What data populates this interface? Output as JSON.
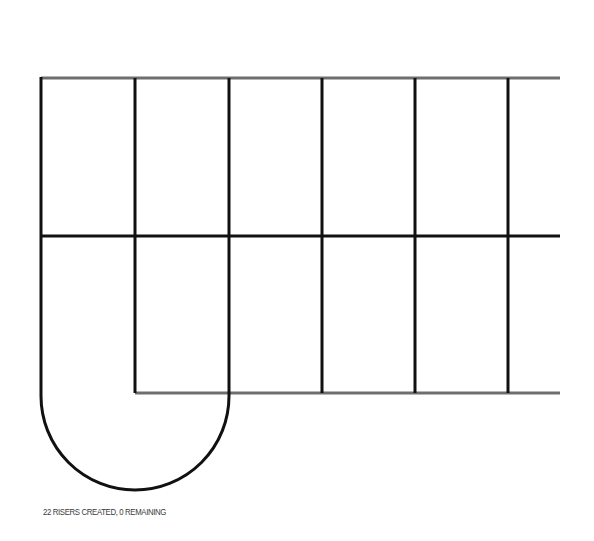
{
  "diagram": {
    "colors": {
      "background": "#ffffff",
      "edge_gray": "#6e6e6e",
      "riser_black": "#111111"
    },
    "outer": {
      "top_y": 78,
      "mid_y": 236,
      "bottom_y": 393,
      "left_x": 41,
      "right_x": 560
    },
    "risers_x": [
      135,
      229,
      322,
      415,
      508
    ],
    "landing_arc": {
      "cx": 136,
      "cy": 395,
      "r": 95
    }
  },
  "status": {
    "message": "22 RISERS CREATED, 0 REMAINING"
  }
}
